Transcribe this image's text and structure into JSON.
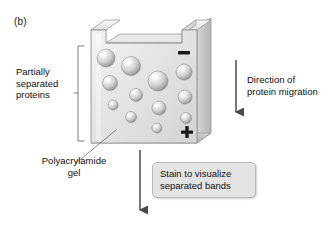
{
  "figure": {
    "panel_letter": "(b)",
    "type": "polyacrylamide-gel-electrophoresis-diagram"
  },
  "labels": {
    "left_bracket_label": "Partially\nseparated\nproteins",
    "right_arrow_label": "Direction of\nprotein migration",
    "gel_leader_label": "Polyacrylamide\ngel",
    "stain_box_label": "Stain to visualize\nseparated bands"
  },
  "electrodes": {
    "negative_symbol": "–",
    "negative_position": "top-right",
    "positive_symbol": "+",
    "positive_position": "bottom-right"
  },
  "colors": {
    "gel_face": "#e3e3e3",
    "gel_face_light": "#f2f2f2",
    "gel_top": "#f0f0f0",
    "gel_side": "#c9c9c9",
    "gel_outline": "#9a9a9a",
    "sphere_light": "#fafafa",
    "sphere_mid": "#d2d2d2",
    "sphere_dark": "#9b9b9b",
    "callout_bg": "#e4e4e4",
    "callout_border": "#b9b9b9",
    "arrow": "#4a4a4a",
    "bracket": "#6f6f6f",
    "leader": "#7a7a7a",
    "text": "#111111",
    "background": "#ffffff"
  },
  "chart_data": {
    "type": "diagram",
    "proteins": [
      {
        "id": 1,
        "cx": 106,
        "cy": 58,
        "r": 9.0
      },
      {
        "id": 2,
        "cx": 131,
        "cy": 66,
        "r": 9.5
      },
      {
        "id": 3,
        "cx": 184,
        "cy": 72,
        "r": 8.0
      },
      {
        "id": 4,
        "cx": 158,
        "cy": 81,
        "r": 10.0
      },
      {
        "id": 5,
        "cx": 110,
        "cy": 83,
        "r": 7.5
      },
      {
        "id": 6,
        "cx": 136,
        "cy": 95,
        "r": 6.5
      },
      {
        "id": 7,
        "cx": 185,
        "cy": 97,
        "r": 7.0
      },
      {
        "id": 8,
        "cx": 113,
        "cy": 105,
        "r": 5.0
      },
      {
        "id": 9,
        "cx": 159,
        "cy": 108,
        "r": 7.0
      },
      {
        "id": 10,
        "cx": 131,
        "cy": 117,
        "r": 5.5
      },
      {
        "id": 11,
        "cx": 186,
        "cy": 118,
        "r": 5.5
      },
      {
        "id": 12,
        "cx": 157,
        "cy": 128,
        "r": 5.0
      }
    ],
    "gradient_note": "larger spots near the negative electrode at top, smaller spots near the positive electrode at bottom"
  }
}
